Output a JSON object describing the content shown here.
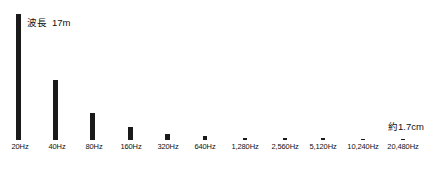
{
  "chart_data": {
    "type": "bar",
    "title": "",
    "subtitle": "",
    "xlabel": "",
    "ylabel": "",
    "grid": false,
    "legend": null,
    "categories": [
      "20Hz",
      "40Hz",
      "80Hz",
      "160Hz",
      "320Hz",
      "640Hz",
      "1,280Hz",
      "2,560Hz",
      "5,120Hz",
      "10,240Hz",
      "20,480Hz"
    ],
    "values": [
      126,
      60,
      27,
      13,
      6.5,
      3.5,
      2,
      1.5,
      1.2,
      1,
      1
    ],
    "ylim": [
      0,
      130
    ],
    "bar_color": "#1a1a1a",
    "annotations": [
      {
        "name": "wavelength-low",
        "label": "波長",
        "value": "17m",
        "target_category": "20Hz"
      },
      {
        "name": "wavelength-high",
        "label": "",
        "value": "約1.7cm",
        "target_category": "20,480Hz"
      }
    ]
  },
  "annotations": {
    "left": {
      "label": "波長",
      "value": "17m"
    },
    "right": {
      "value": "約1.7cm"
    }
  },
  "axis": {
    "ticks": [
      {
        "label": "20Hz",
        "x": 20
      },
      {
        "label": "40Hz",
        "x": 57
      },
      {
        "label": "80Hz",
        "x": 94
      },
      {
        "label": "160Hz",
        "x": 131
      },
      {
        "label": "320Hz",
        "x": 168
      },
      {
        "label": "640Hz",
        "x": 205
      },
      {
        "label": "1,280Hz",
        "x": 245
      },
      {
        "label": "2,560Hz",
        "x": 285
      },
      {
        "label": "5,120Hz",
        "x": 323
      },
      {
        "label": "10,240Hz",
        "x": 363
      },
      {
        "label": "20,480Hz",
        "x": 403
      }
    ]
  },
  "bars": [
    {
      "name": "bar-20hz",
      "x": 16,
      "width": 5,
      "height": 126
    },
    {
      "name": "bar-40hz",
      "x": 53,
      "width": 5,
      "height": 60
    },
    {
      "name": "bar-80hz",
      "x": 90,
      "width": 5,
      "height": 27
    },
    {
      "name": "bar-160hz",
      "x": 128,
      "width": 5,
      "height": 13
    },
    {
      "name": "bar-320hz",
      "x": 165,
      "width": 5,
      "height": 6.5
    },
    {
      "name": "bar-640hz",
      "x": 203,
      "width": 4,
      "height": 4
    },
    {
      "name": "bar-1280hz",
      "x": 243,
      "width": 4,
      "height": 2.5
    },
    {
      "name": "bar-2560hz",
      "x": 283,
      "width": 4,
      "height": 2
    },
    {
      "name": "bar-5120hz",
      "x": 321,
      "width": 4,
      "height": 1.6
    },
    {
      "name": "bar-10240hz",
      "x": 361,
      "width": 4,
      "height": 1.3
    },
    {
      "name": "bar-20480hz",
      "x": 401,
      "width": 4,
      "height": 1.2
    }
  ]
}
